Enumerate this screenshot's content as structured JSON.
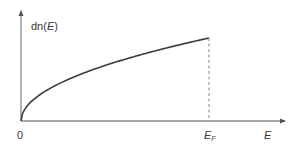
{
  "diagram": {
    "y_axis_label_prefix": "dn(",
    "y_axis_label_var": "E",
    "y_axis_label_suffix": ")",
    "x_axis_label": "E",
    "origin_label": "0",
    "fermi_label_main": "E",
    "fermi_label_sub": "F",
    "curve": "square-root density of states from 0 to Fermi energy",
    "colors": {
      "axis": "#888888",
      "curve": "#3c3c3c",
      "dashed": "#888888",
      "text": "#3a3a3a"
    }
  }
}
